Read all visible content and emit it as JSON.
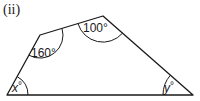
{
  "diagram": {
    "part_label": "(ii)",
    "shape": "quadrilateral",
    "vertices": [
      {
        "name": "bottom-left",
        "x": 7,
        "y": 95
      },
      {
        "name": "upper-left",
        "x": 40,
        "y": 35
      },
      {
        "name": "top",
        "x": 103,
        "y": 16
      },
      {
        "name": "bottom-right",
        "x": 193,
        "y": 95
      }
    ],
    "angles": {
      "upper_left": "160°",
      "top": "100°",
      "bottom_left": "x°",
      "bottom_right": "y°"
    },
    "angle_parts": {
      "bottom_left_var": "x",
      "bottom_right_var": "y",
      "degree": "°"
    },
    "stroke_color": "#1a1a1a"
  }
}
